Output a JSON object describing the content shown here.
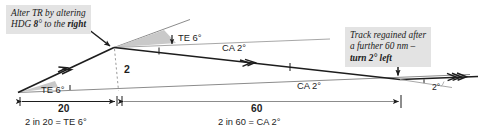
{
  "diagram": {
    "callouts": [
      {
        "id": "alter-heading",
        "line1": "Alter TR by altering",
        "line2_pre": "HDG ",
        "line2_bold": "8",
        "line2_mid": "° to the ",
        "line2_bold2": "right"
      },
      {
        "id": "track-regained",
        "line1": "Track regained after",
        "line2": "a further 60 nm –",
        "line3_bold": "turn 2° left"
      }
    ],
    "angle_labels": {
      "te_left": "TE 6°",
      "te_top": "TE 6°",
      "ca_top": "CA 2°",
      "ca_mid": "CA 2°",
      "closing": "2°"
    },
    "offset_label": "2",
    "dimensions": [
      {
        "id": "leg-1",
        "value": "20",
        "caption": "2 in 20 = TE 6°"
      },
      {
        "id": "leg-2",
        "value": "60",
        "caption": "2 in 60 = CA 2°"
      }
    ],
    "colors": {
      "ink": "#1d1d1d",
      "callout_bg": "#e3e3e3",
      "wedge_fill": "#c9c9c9",
      "thin_line": "#8c8c8c",
      "dashed": "#9a9a9a"
    }
  }
}
